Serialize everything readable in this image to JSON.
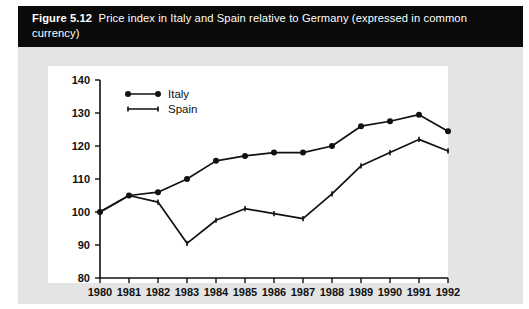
{
  "figure": {
    "label": "Figure 5.12",
    "caption": "Price index in Italy and Spain relative to Germany (expressed in common currency)",
    "caption_full": "Figure 5.12  Price index in Italy and Spain relative to Germany (expressed in common currency)"
  },
  "colors": {
    "caption_bar": "#0a0a0a",
    "caption_text": "#ffffff",
    "page_panel": "#e4e4e4",
    "plot_background": "#ffffff",
    "axis": "#111111",
    "italy_series": "#111111",
    "spain_series": "#111111"
  },
  "legend": {
    "position": "top-left-inside",
    "entries": [
      {
        "label": "Italy",
        "marker": "filled-circle"
      },
      {
        "label": "Spain",
        "marker": "small-tick"
      }
    ]
  },
  "axes": {
    "y_ticks": [
      "140",
      "130",
      "120",
      "110",
      "100",
      "90",
      "80"
    ],
    "x_ticks": [
      "1980",
      "1981",
      "1982",
      "1983",
      "1984",
      "1985",
      "1986",
      "1987",
      "1988",
      "1989",
      "1990",
      "1991",
      "1992"
    ]
  },
  "chart_data": {
    "type": "line",
    "title": "Price index in Italy and Spain relative to Germany (expressed in common currency)",
    "xlabel": "",
    "ylabel": "",
    "x": [
      1980,
      1981,
      1982,
      1983,
      1984,
      1985,
      1986,
      1987,
      1988,
      1989,
      1990,
      1991,
      1992
    ],
    "categories": [
      "1980",
      "1981",
      "1982",
      "1983",
      "1984",
      "1985",
      "1986",
      "1987",
      "1988",
      "1989",
      "1990",
      "1991",
      "1992"
    ],
    "series": [
      {
        "name": "Italy",
        "marker": "filled-circle",
        "values": [
          100,
          105,
          106,
          110,
          115.5,
          117,
          118,
          118,
          120,
          126,
          127.5,
          129.5,
          124.5
        ]
      },
      {
        "name": "Spain",
        "marker": "small-tick",
        "values": [
          100,
          105,
          103,
          90.5,
          97.5,
          101,
          99.5,
          98,
          105.5,
          114,
          118,
          122,
          118.5
        ]
      }
    ],
    "ylim": [
      80,
      140
    ],
    "xlim": [
      1980,
      1992
    ],
    "yticks": [
      80,
      90,
      100,
      110,
      120,
      130,
      140
    ],
    "grid": false,
    "legend_position": "upper left"
  }
}
